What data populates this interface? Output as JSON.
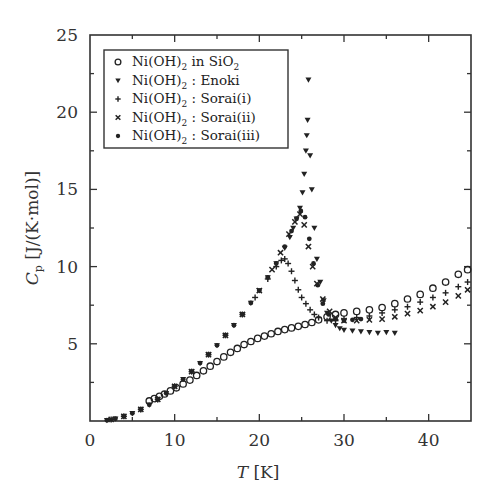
{
  "chart_data": {
    "type": "scatter",
    "title": "",
    "xlabel": "T [K]",
    "ylabel": "Cp [J/(K·mol)]",
    "xlim": [
      0,
      45
    ],
    "ylim": [
      0,
      25
    ],
    "x_ticks": [
      0,
      10,
      20,
      30,
      40
    ],
    "y_ticks": [
      5,
      10,
      15,
      20,
      25
    ],
    "grid": false,
    "legend_position": "upper-left",
    "legend": [
      {
        "label": "Ni(OH)2 in SiO2",
        "marker": "open-circle"
      },
      {
        "label": "Ni(OH)2 : Enoki",
        "marker": "down-triangle"
      },
      {
        "label": "Ni(OH)2 : Sorai(i)",
        "marker": "plus"
      },
      {
        "label": "Ni(OH)2 : Sorai(ii)",
        "marker": "cross"
      },
      {
        "label": "Ni(OH)2 : Sorai(iii)",
        "marker": "dot"
      }
    ],
    "series": [
      {
        "name": "Ni(OH)2 in SiO2",
        "marker": "open-circle",
        "x": [
          7.0,
          7.6,
          8.2,
          8.8,
          9.5,
          10.2,
          11.0,
          11.8,
          12.6,
          13.4,
          14.2,
          15.0,
          15.8,
          16.6,
          17.4,
          18.2,
          19.0,
          19.8,
          20.6,
          21.4,
          22.2,
          23.0,
          23.8,
          24.6,
          25.4,
          26.2,
          27.0,
          28.0,
          29.0,
          30.0,
          31.5,
          33.0,
          34.5,
          36.0,
          37.5,
          39.0,
          40.5,
          42.0,
          43.5,
          44.6
        ],
        "y": [
          1.3,
          1.45,
          1.6,
          1.75,
          1.95,
          2.15,
          2.4,
          2.65,
          2.95,
          3.25,
          3.55,
          3.85,
          4.15,
          4.45,
          4.7,
          4.95,
          5.15,
          5.35,
          5.5,
          5.65,
          5.8,
          5.92,
          6.03,
          6.13,
          6.25,
          6.38,
          6.55,
          6.75,
          6.9,
          7.0,
          7.1,
          7.2,
          7.35,
          7.6,
          7.9,
          8.2,
          8.6,
          9.0,
          9.5,
          9.8
        ]
      },
      {
        "name": "Ni(OH)2 : Enoki",
        "marker": "down-triangle",
        "x": [
          2.0,
          3.0,
          4.0,
          5.0,
          6.0,
          7.0,
          8.0,
          9.0,
          10.0,
          11.0,
          12.0,
          13.0,
          14.0,
          15.0,
          16.0,
          17.0,
          18.0,
          19.0,
          20.0,
          21.0,
          22.0,
          23.0,
          23.6,
          24.0,
          24.4,
          24.8,
          25.1,
          25.3,
          25.5,
          25.6,
          25.7,
          25.8,
          26.0,
          26.2,
          26.5,
          26.8,
          27.2,
          27.6,
          28.0,
          28.5,
          29.0,
          29.5,
          30.0,
          31.0,
          32.0,
          33.0,
          34.0,
          35.0,
          36.0
        ],
        "y": [
          0.05,
          0.15,
          0.3,
          0.5,
          0.75,
          1.05,
          1.4,
          1.8,
          2.25,
          2.7,
          3.2,
          3.75,
          4.3,
          4.9,
          5.55,
          6.2,
          6.9,
          7.65,
          8.45,
          9.3,
          10.2,
          11.2,
          11.9,
          12.5,
          13.1,
          13.8,
          14.8,
          16.0,
          17.5,
          18.5,
          19.5,
          22.1,
          17.2,
          15.0,
          12.5,
          10.5,
          9.0,
          7.8,
          7.0,
          6.5,
          6.2,
          6.0,
          5.9,
          5.85,
          5.8,
          5.75,
          5.7,
          5.75,
          5.7
        ]
      },
      {
        "name": "Ni(OH)2 : Sorai(i)",
        "marker": "plus",
        "x": [
          2.5,
          4.0,
          6.0,
          8.0,
          10.0,
          12.0,
          14.0,
          16.0,
          18.0,
          19.5,
          21.0,
          22.0,
          22.6,
          23.0,
          23.4,
          23.8,
          24.2,
          24.6,
          25.0,
          25.5,
          26.0,
          26.5,
          27.0,
          28.0,
          29.0,
          30.0,
          31.5,
          33.0,
          34.5,
          36.0,
          37.5,
          39.0,
          40.5,
          42.0,
          43.5,
          44.6
        ],
        "y": [
          0.1,
          0.3,
          0.75,
          1.4,
          2.25,
          3.2,
          4.3,
          5.55,
          6.9,
          8.0,
          9.2,
          10.0,
          10.4,
          10.5,
          10.2,
          9.7,
          9.1,
          8.5,
          8.0,
          7.6,
          7.2,
          6.9,
          6.7,
          6.5,
          6.5,
          6.6,
          6.7,
          6.8,
          7.0,
          7.2,
          7.4,
          7.7,
          8.0,
          8.3,
          8.7,
          9.0
        ]
      },
      {
        "name": "Ni(OH)2 : Sorai(ii)",
        "marker": "cross",
        "x": [
          2.5,
          4.0,
          6.0,
          8.0,
          10.0,
          12.0,
          14.0,
          16.0,
          18.0,
          20.0,
          21.5,
          22.5,
          23.5,
          24.2,
          24.8,
          25.3,
          25.8,
          26.3,
          26.8,
          27.5,
          28.3,
          29.0,
          30.0,
          31.5,
          33.0,
          34.5,
          36.0,
          37.5,
          39.0,
          40.5,
          42.0,
          43.5,
          44.6
        ],
        "y": [
          0.1,
          0.3,
          0.75,
          1.4,
          2.25,
          3.2,
          4.3,
          5.55,
          6.9,
          8.45,
          9.8,
          10.9,
          12.1,
          12.9,
          13.4,
          12.7,
          11.3,
          10.0,
          8.9,
          7.9,
          7.1,
          6.7,
          6.5,
          6.5,
          6.55,
          6.6,
          6.75,
          6.95,
          7.15,
          7.4,
          7.7,
          8.1,
          8.5
        ]
      },
      {
        "name": "Ni(OH)2 : Sorai(iii)",
        "marker": "dot",
        "x": [
          2.0,
          3.0,
          4.0,
          5.0,
          6.0,
          7.0,
          8.0,
          9.0,
          10.0,
          11.0,
          12.0,
          13.0,
          14.0,
          15.0,
          16.0,
          17.0,
          18.0,
          19.0,
          20.0,
          21.0,
          22.0,
          23.0,
          23.8,
          24.4,
          24.9,
          25.4,
          25.9,
          26.4,
          26.9,
          27.5,
          28.2,
          29.0,
          30.0,
          31.0,
          32.0
        ],
        "y": [
          0.05,
          0.15,
          0.3,
          0.5,
          0.75,
          1.05,
          1.4,
          1.8,
          2.25,
          2.7,
          3.2,
          3.75,
          4.3,
          4.9,
          5.55,
          6.2,
          6.9,
          7.65,
          8.45,
          9.3,
          10.2,
          11.3,
          12.3,
          13.1,
          13.6,
          13.2,
          11.8,
          10.2,
          8.8,
          7.6,
          6.9,
          6.6,
          6.5,
          6.55,
          6.6
        ]
      }
    ]
  },
  "legend_labels": [
    {
      "main": "Ni(OH)",
      "sub": "2",
      "rest": " in SiO",
      "sub2": "2"
    },
    {
      "main": "Ni(OH)",
      "sub": "2",
      "rest": " : Enoki",
      "sub2": ""
    },
    {
      "main": "Ni(OH)",
      "sub": "2",
      "rest": " : Sorai(i)",
      "sub2": ""
    },
    {
      "main": "Ni(OH)",
      "sub": "2",
      "rest": " : Sorai(ii)",
      "sub2": ""
    },
    {
      "main": "Ni(OH)",
      "sub": "2",
      "rest": " : Sorai(iii)",
      "sub2": ""
    }
  ],
  "axis_titles": {
    "x_italic": "T",
    "x_unit": " [K]",
    "y_italic": "C",
    "y_sub": "p",
    "y_unit": " [J/(K·mol)]"
  },
  "colors": {
    "ink": "#222222",
    "frame": "#333333",
    "background": "#ffffff"
  }
}
